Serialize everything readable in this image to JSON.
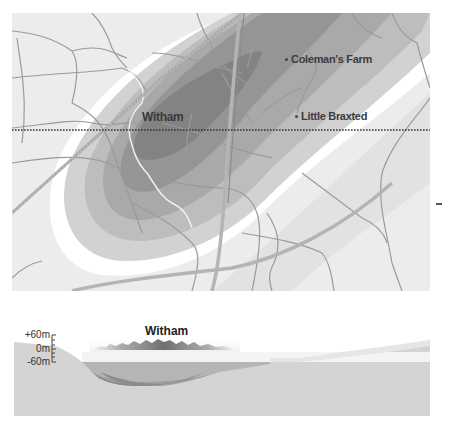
{
  "map": {
    "labels": {
      "town": "Witham",
      "village_1": "Coleman's Farm",
      "village_2": "Little Braxted"
    },
    "section_line": "dotted-horizontal",
    "colors": {
      "background": "#ececec",
      "halo": "#ffffff",
      "zone_1": "#d2d2d2",
      "zone_2": "#bdbdbd",
      "zone_3": "#a9a9a9",
      "zone_4": "#959595",
      "zone_5": "#838383",
      "roads": "#9a9a9a",
      "river": "#f2f2f2",
      "railway": "#a0a0a0"
    }
  },
  "cross_section": {
    "title": "Witham",
    "scale": {
      "top": "+60m",
      "middle": "0m",
      "bottom": "-60m"
    },
    "colors": {
      "ground": "#d4d4d4",
      "layer_1": "#b5b5b5",
      "layer_2": "#9d9d9d",
      "layer_3": "#858585",
      "skyline": "#8a8a8a"
    }
  }
}
